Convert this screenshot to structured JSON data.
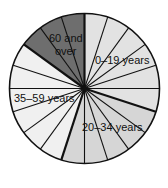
{
  "chart_data": {
    "type": "pie",
    "title": "",
    "categories": [
      "0–19 years",
      "20–34 years",
      "35–59 years",
      "60 and over"
    ],
    "values": [
      30,
      25,
      30,
      15
    ],
    "wedge_counts": [
      6,
      5,
      6,
      3
    ],
    "total_wedges": 20,
    "units": "percent (each wedge = 5%)",
    "colors": [
      "#e2e2e2",
      "#d6d6d6",
      "#f0f0f0",
      "#6e6e6e"
    ],
    "start_angle_deg": 0,
    "direction": "clockwise",
    "legend": "none (labels inside slices)"
  },
  "labels": {
    "age_0_19": "0–19 years",
    "age_20_34": "20–34 years",
    "age_35_59": "35–59 years",
    "age_60_line1": "60 and",
    "age_60_line2": "over"
  }
}
